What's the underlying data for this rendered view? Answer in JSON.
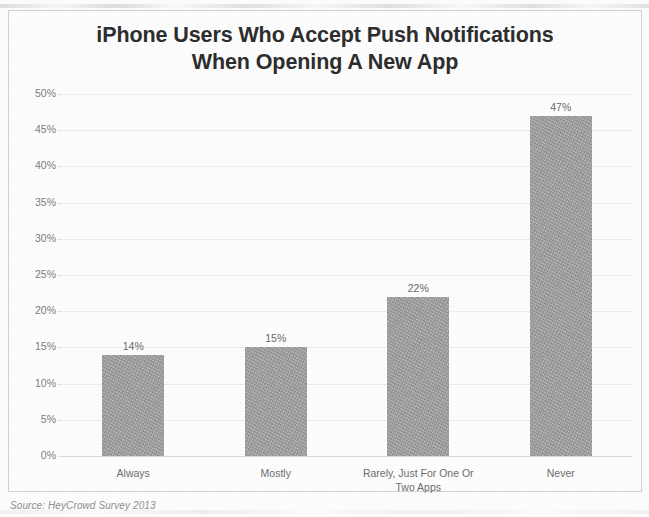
{
  "chart_data": {
    "type": "bar",
    "title": "iPhone Users Who Accept Push Notifications When Opening A New App",
    "title_line1": "iPhone Users Who Accept Push Notifications",
    "title_line2": "When Opening A New App",
    "categories": [
      "Always",
      "Mostly",
      "Rarely, Just For One Or Two Apps",
      "Never"
    ],
    "values": [
      14,
      15,
      22,
      47
    ],
    "value_labels": [
      "14%",
      "15%",
      "22%",
      "47%"
    ],
    "xlabel": "",
    "ylabel": "% Of Total Who ___ Accept Push Notifications",
    "ylim": [
      0,
      50
    ],
    "ytick_labels": [
      "50%",
      "45%",
      "40%",
      "35%",
      "30%",
      "25%",
      "20%",
      "15%",
      "10%",
      "5%",
      "0%"
    ],
    "ytick_values": [
      50,
      45,
      40,
      35,
      30,
      25,
      20,
      15,
      10,
      5,
      0
    ],
    "grid": true,
    "legend": false,
    "bar_color": "#a3a3a3",
    "text_color": "#6e6e6e",
    "title_color": "#2e2e2e",
    "gridline_color": "#ededed",
    "frame_color": "#d2d2d2"
  },
  "source": {
    "text": "Source: HeyCrowd Survey 2013"
  }
}
